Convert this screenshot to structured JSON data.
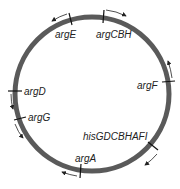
{
  "diagram": {
    "type": "circular genetic map",
    "circle": {
      "cx": 92,
      "cy": 94,
      "r": 77,
      "stroke": "#5a5a5a",
      "stroke_width": 5
    },
    "genes": [
      {
        "label": "argE",
        "tick": [
          70,
          20
        ],
        "direction": "counterclockwise"
      },
      {
        "label": "argCBH",
        "tick": [
          104,
          17
        ],
        "direction": "clockwise"
      },
      {
        "label": "argF",
        "tick": [
          168,
          82
        ],
        "direction": "counterclockwise"
      },
      {
        "label": "argD",
        "tick": [
          14,
          91
        ],
        "direction": "counterclockwise"
      },
      {
        "label": "argG",
        "tick": [
          20,
          118
        ],
        "direction": "counterclockwise"
      },
      {
        "label": "hisGDCBHAFI",
        "tick": [
          153,
          145
        ],
        "direction": "clockwise"
      },
      {
        "label": "argA",
        "tick": [
          81,
          171
        ],
        "direction": "clockwise"
      }
    ]
  }
}
